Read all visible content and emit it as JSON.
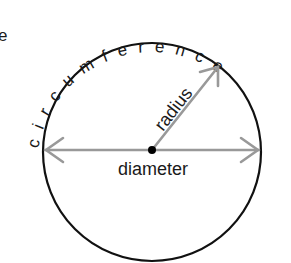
{
  "diagram": {
    "stray_letter": "e",
    "circumference_label": "circumference",
    "radius_label": "radius",
    "diameter_label": "diameter",
    "colors": {
      "circle": "#111111",
      "arrow": "#999999",
      "text": "#1a1a1a",
      "center_dot": "#000000"
    }
  }
}
